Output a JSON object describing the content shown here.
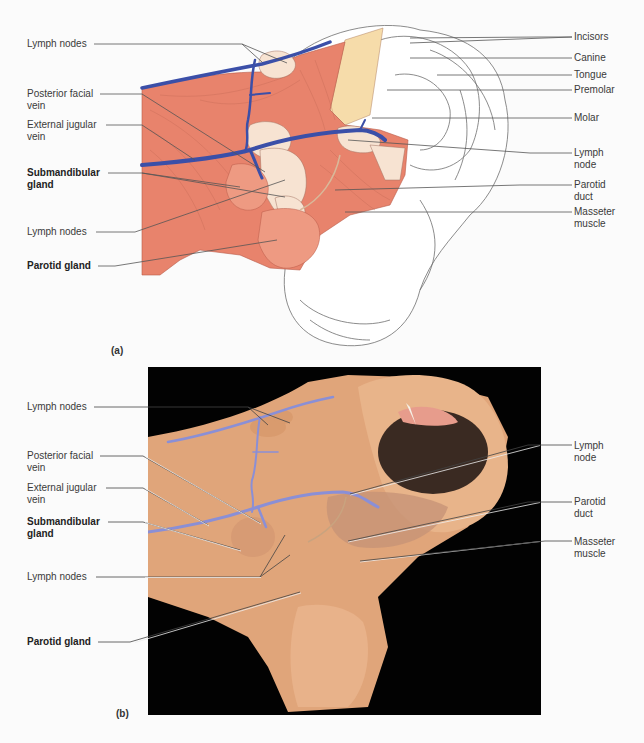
{
  "figure": {
    "panel_a": {
      "letter": "(a)",
      "type": "illustration",
      "left_labels": [
        {
          "text": "Lymph nodes",
          "bold": false
        },
        {
          "text": "Posterior facial\nvein",
          "bold": false
        },
        {
          "text": "External jugular\nvein",
          "bold": false
        },
        {
          "text": "Submandibular\ngland",
          "bold": true
        },
        {
          "text": "Lymph nodes",
          "bold": false
        },
        {
          "text": "Parotid gland",
          "bold": true
        }
      ],
      "right_labels": [
        {
          "text": "Incisors"
        },
        {
          "text": "Canine"
        },
        {
          "text": "Tongue"
        },
        {
          "text": "Premolar"
        },
        {
          "text": "Molar"
        },
        {
          "text": "Lymph\nnode"
        },
        {
          "text": "Parotid\nduct"
        },
        {
          "text": "Masseter\nmuscle"
        }
      ]
    },
    "panel_b": {
      "letter": "(b)",
      "type": "photograph",
      "left_labels": [
        {
          "text": "Lymph nodes",
          "bold": false
        },
        {
          "text": "Posterior facial\nvein",
          "bold": false
        },
        {
          "text": "External jugular\nvein",
          "bold": false
        },
        {
          "text": "Submandibular\ngland",
          "bold": true
        },
        {
          "text": "Lymph nodes",
          "bold": false
        },
        {
          "text": "Parotid gland",
          "bold": true
        }
      ],
      "right_labels": [
        {
          "text": "Lymph\nnode"
        },
        {
          "text": "Parotid\nduct"
        },
        {
          "text": "Masseter\nmuscle"
        }
      ]
    },
    "colors": {
      "muscle": "#e8836c",
      "muscle_stroke": "#b85a48",
      "vein_drawing": "#3b4fa8",
      "gland_light": "#f7e3d2",
      "bone_yellow": "#f6dcaa",
      "skin_photo": "#e3aa7f",
      "vein_photo": "#8a8fd6",
      "photo_bg": "#020202"
    }
  }
}
